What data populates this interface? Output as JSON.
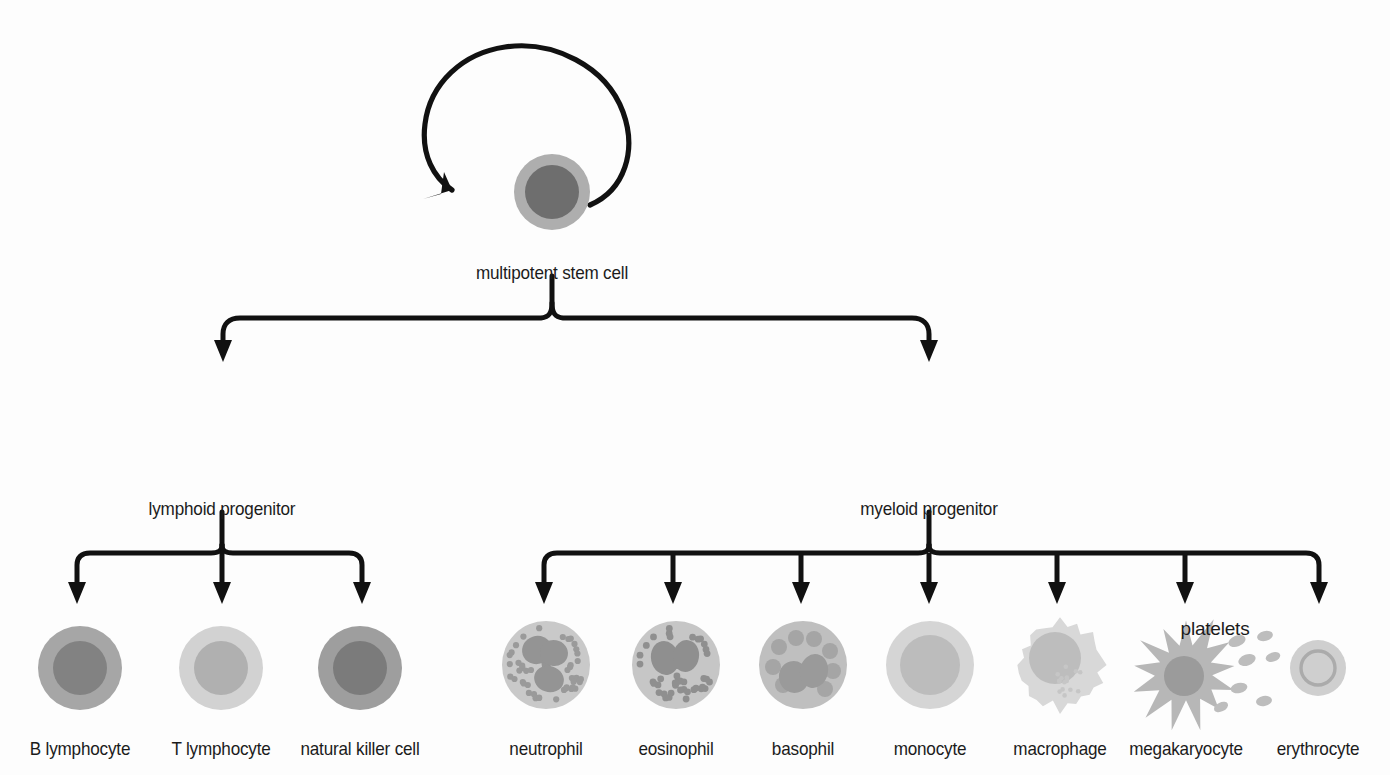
{
  "diagram": {
    "background_color": "#fdfdfd",
    "line_color": "#111111",
    "text_color": "#1b1b1b"
  },
  "tiers": {
    "stem": {
      "label": "multipotent stem cell",
      "self_renewal_arrow": true,
      "x": 552,
      "y": 192,
      "label_y": 262
    },
    "progenitors": [
      {
        "id": "lymphoid-progenitor",
        "label": "lymphoid progenitor",
        "x": 222,
        "y": 428,
        "label_y": 498,
        "cytoplasm": "#a8a8a8",
        "nucleus": "#6e6e6e",
        "radius": 44,
        "nucleus_radius": 30
      },
      {
        "id": "myeloid-progenitor",
        "label": "myeloid progenitor",
        "x": 929,
        "y": 428,
        "label_y": 498,
        "cytoplasm": "#a3a3a3",
        "nucleus": "#737373",
        "radius": 46,
        "nucleus_radius": 32
      }
    ],
    "lymphoid_cells": [
      {
        "id": "b-lymphocyte",
        "label": "B lymphocyte",
        "x": 80,
        "y": 668,
        "label_y": 738,
        "type": "simple",
        "cytoplasm": "#a6a6a6",
        "nucleus": "#828282",
        "radius": 42,
        "nucleus_radius": 27
      },
      {
        "id": "t-lymphocyte",
        "label": "T lymphocyte",
        "x": 221,
        "y": 668,
        "label_y": 738,
        "type": "simple",
        "cytoplasm": "#d2d2d2",
        "nucleus": "#b0b0b0",
        "radius": 42,
        "nucleus_radius": 27
      },
      {
        "id": "natural-killer-cell",
        "label": "natural killer cell",
        "x": 360,
        "y": 668,
        "label_y": 738,
        "type": "simple",
        "cytoplasm": "#9e9e9e",
        "nucleus": "#7b7b7b",
        "radius": 42,
        "nucleus_radius": 27
      }
    ],
    "myeloid_cells": [
      {
        "id": "neutrophil",
        "label": "neutrophil",
        "x": 546,
        "y": 665,
        "label_y": 738,
        "type": "granulocyte",
        "cytoplasm": "#c9c9c9",
        "nucleus": "#949494",
        "granule": "#9a9a9a",
        "granule_size": 3.1,
        "granule_count": 46,
        "lobes": 3,
        "radius": 44
      },
      {
        "id": "eosinophil",
        "label": "eosinophil",
        "x": 676,
        "y": 665,
        "label_y": 738,
        "type": "granulocyte",
        "cytoplasm": "#c6c6c6",
        "nucleus": "#8f8f8f",
        "granule": "#8f8f8f",
        "granule_size": 3.4,
        "granule_count": 40,
        "lobes": 2,
        "radius": 44
      },
      {
        "id": "basophil",
        "label": "basophil",
        "x": 803,
        "y": 665,
        "label_y": 738,
        "type": "basophil",
        "cytoplasm": "#bfbfbf",
        "nucleus": "#9a9a9a",
        "granule": "#a5a5a5",
        "granule_size": 8,
        "granule_count": 9,
        "radius": 44
      },
      {
        "id": "monocyte",
        "label": "monocyte",
        "x": 930,
        "y": 665,
        "label_y": 738,
        "type": "simple",
        "cytoplasm": "#d5d5d5",
        "nucleus": "#bcbcbc",
        "radius": 44,
        "nucleus_radius": 30
      },
      {
        "id": "macrophage",
        "label": "macrophage",
        "x": 1060,
        "y": 665,
        "label_y": 738,
        "type": "macrophage",
        "cytoplasm": "#d8d8d8",
        "nucleus": "#bdbdbd",
        "radius": 44,
        "nucleus_radius": 26
      },
      {
        "id": "megakaryocyte",
        "label": "megakaryocyte",
        "x": 1186,
        "y": 672,
        "label_y": 738,
        "type": "megakaryocyte",
        "cytoplasm": "#b7b7b7",
        "nucleus": "#9b9b9b",
        "radius": 46,
        "nucleus_radius": 20
      },
      {
        "id": "erythrocyte",
        "label": "erythrocyte",
        "x": 1318,
        "y": 668,
        "label_y": 738,
        "type": "erythrocyte",
        "cytoplasm": "#cfcfcf",
        "nucleus": "#ababab",
        "radius": 28,
        "nucleus_radius": 17
      }
    ],
    "platelets": {
      "label": "platelets",
      "label_x": 1215,
      "label_y": 618,
      "color": "#bdbdbd",
      "ovals": [
        {
          "x": 1237,
          "y": 641,
          "rx": 9,
          "ry": 5.5,
          "rot": -22
        },
        {
          "x": 1265,
          "y": 636,
          "rx": 8,
          "ry": 5,
          "rot": -14
        },
        {
          "x": 1247,
          "y": 660,
          "rx": 9,
          "ry": 5.5,
          "rot": -20
        },
        {
          "x": 1273,
          "y": 657,
          "rx": 7.5,
          "ry": 4.5,
          "rot": -18
        },
        {
          "x": 1239,
          "y": 688,
          "rx": 8.5,
          "ry": 5,
          "rot": -12
        },
        {
          "x": 1264,
          "y": 701,
          "rx": 8,
          "ry": 5,
          "rot": -10
        },
        {
          "x": 1221,
          "y": 707,
          "rx": 7.5,
          "ry": 4.5,
          "rot": -25
        }
      ]
    }
  }
}
